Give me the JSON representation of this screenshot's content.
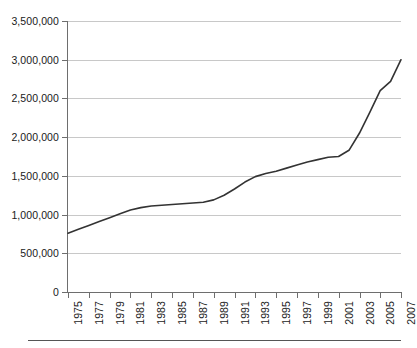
{
  "chart_data": {
    "type": "line",
    "title": "",
    "subtitle": "",
    "xlabel": "",
    "ylabel": "",
    "xlim": [
      1975,
      2007
    ],
    "ylim": [
      0,
      3500000
    ],
    "grid": "horizontal",
    "legend": "none",
    "y_ticks": [
      0,
      500000,
      1000000,
      1500000,
      2000000,
      2500000,
      3000000,
      3500000
    ],
    "y_tick_labels": [
      "0",
      "500,000",
      "1,000,000",
      "1,500,000",
      "2,000,000",
      "2,500,000",
      "3,000,000",
      "3,500,000"
    ],
    "x_ticks": [
      1975,
      1977,
      1979,
      1981,
      1983,
      1985,
      1987,
      1989,
      1991,
      1993,
      1995,
      1997,
      1999,
      2001,
      2003,
      2005,
      2007
    ],
    "x_tick_labels": [
      "1975",
      "1977",
      "1979",
      "1981",
      "1983",
      "1985",
      "1987",
      "1989",
      "1991",
      "1993",
      "1995",
      "1997",
      "1999",
      "2001",
      "2003",
      "2005",
      "2007"
    ],
    "series": [
      {
        "name": "",
        "color": "#333333",
        "x": [
          1975,
          1976,
          1977,
          1978,
          1979,
          1980,
          1981,
          1982,
          1983,
          1984,
          1985,
          1986,
          1987,
          1988,
          1989,
          1990,
          1991,
          1992,
          1993,
          1994,
          1995,
          1996,
          1997,
          1998,
          1999,
          2000,
          2001,
          2002,
          2003,
          2004,
          2005,
          2006,
          2007
        ],
        "values": [
          760000,
          810000,
          860000,
          910000,
          960000,
          1010000,
          1060000,
          1090000,
          1110000,
          1120000,
          1130000,
          1140000,
          1150000,
          1160000,
          1190000,
          1250000,
          1330000,
          1420000,
          1490000,
          1530000,
          1560000,
          1600000,
          1640000,
          1680000,
          1710000,
          1740000,
          1750000,
          1830000,
          2050000,
          2320000,
          2600000,
          2720000,
          3000000
        ]
      }
    ]
  },
  "axis": {
    "y_title": "",
    "x_title": ""
  }
}
